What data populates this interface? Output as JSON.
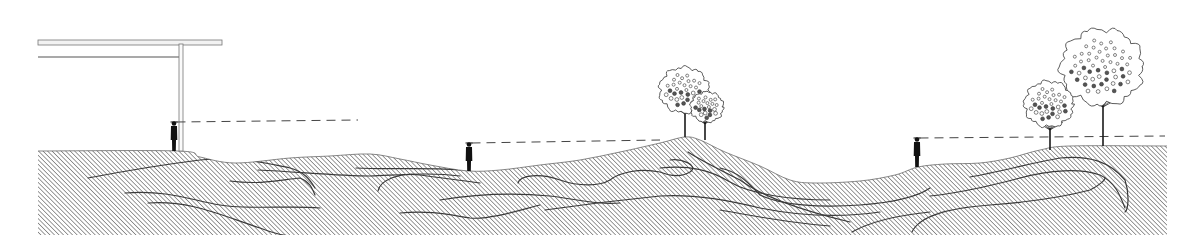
{
  "diagram": {
    "type": "landscape-section",
    "description": "Site section with hatched earth mounds, three observers with dashed sight lines, canopy structure and trees",
    "colors": {
      "background": "#ffffff",
      "ink": "#1a1a1a",
      "hatch": "#4a4a4a",
      "strata": "#3a3a3a",
      "figure": "#111111",
      "canopy_fill": "#f2f2f2"
    },
    "ground": {
      "bottom_y": 235,
      "left_x": 38,
      "right_x": 1167,
      "profile": [
        [
          38,
          151
        ],
        [
          178,
          151
        ],
        [
          200,
          157
        ],
        [
          235,
          163
        ],
        [
          290,
          158
        ],
        [
          330,
          156
        ],
        [
          370,
          154
        ],
        [
          400,
          159
        ],
        [
          430,
          165
        ],
        [
          468,
          171
        ],
        [
          500,
          170
        ],
        [
          540,
          165
        ],
        [
          580,
          160
        ],
        [
          620,
          152
        ],
        [
          660,
          143
        ],
        [
          685,
          137
        ],
        [
          700,
          140
        ],
        [
          725,
          152
        ],
        [
          760,
          166
        ],
        [
          790,
          180
        ],
        [
          815,
          183
        ],
        [
          860,
          181
        ],
        [
          895,
          175
        ],
        [
          918,
          167
        ],
        [
          945,
          164
        ],
        [
          980,
          163
        ],
        [
          1010,
          158
        ],
        [
          1040,
          150
        ],
        [
          1070,
          146
        ],
        [
          1167,
          146
        ]
      ]
    },
    "strata_lines": [
      "M88,178 C130,170 160,165 200,160 C240,156 260,162 290,168 C305,172 310,180 315,188",
      "M125,193 C170,190 190,200 220,205 C250,210 290,205 320,208",
      "M148,203 C190,200 220,215 260,228 C270,232 280,235 290,236",
      "M230,181 C260,185 280,180 300,178 C310,182 312,188 315,195",
      "M258,170 C300,172 340,176 370,176 C400,175 430,172 460,176",
      "M356,168 C390,170 420,167 460,170",
      "M378,191 C380,180 400,172 420,175 C440,178 460,180 480,183",
      "M400,213 C430,210 450,215 470,218 C490,220 520,210 540,205",
      "M440,200 C470,195 510,192 550,196 C580,200 600,205 620,203",
      "M518,183 C520,175 540,173 560,180 C580,187 600,186 610,180 C620,172 640,168 660,172 C670,176 680,178 690,172 C700,165 680,158 670,160",
      "M545,210 C580,205 620,200 660,196 C690,194 720,198 760,208 C800,216 840,218 880,212",
      "M660,168 C690,165 710,170 730,182 C750,194 790,200 830,200",
      "M688,152 C700,160 720,170 740,180 C760,195 800,210 850,222",
      "M720,168 C740,172 750,185 760,195 C780,205 820,208 860,205 C900,202 920,195 930,188",
      "M720,210 C750,215 780,222 830,226",
      "M930,196 C960,193 990,186 1020,178 C1050,170 1080,168 1100,175 C1115,182 1120,195 1125,208",
      "M970,177 C1000,172 1030,163 1060,158 C1090,155 1110,162 1125,180 C1130,195 1128,210 1125,212",
      "M912,232 C920,215 950,208 990,205 C1030,202 1060,198 1090,190 C1100,185 1105,180 1105,178",
      "M852,232 C870,222 900,215 930,212",
      "M38,237 C50,236 60,236 70,236"
    ],
    "canopy_structure": {
      "roof_top": {
        "x1": 38,
        "y1": 42,
        "x2": 222,
        "y2": 42,
        "thickness": 5
      },
      "beam": {
        "x1": 38,
        "y1": 57,
        "x2": 183,
        "y2": 57
      },
      "column": {
        "x": 181,
        "y_top": 44,
        "y_bottom": 151,
        "width": 4
      }
    },
    "observers": [
      {
        "id": "observer-1",
        "x": 174,
        "foot_y": 151,
        "height": 30,
        "eye_y": 122,
        "sightline_end_x": 358,
        "sightline_y": 120
      },
      {
        "id": "observer-2",
        "x": 469,
        "foot_y": 171,
        "height": 29,
        "eye_y": 143,
        "sightline_end_x": 660,
        "sightline_y": 140
      },
      {
        "id": "observer-3",
        "x": 917,
        "foot_y": 167,
        "height": 30,
        "eye_y": 138,
        "sightline_end_x": 1165,
        "sightline_y": 136
      }
    ],
    "trees": [
      {
        "id": "tree-1",
        "trunk_x": 685,
        "base_y": 137,
        "trunk_top_y": 112,
        "crown_cx": 684,
        "crown_cy": 90,
        "crown_r": 24
      },
      {
        "id": "tree-2",
        "trunk_x": 705,
        "base_y": 140,
        "trunk_top_y": 122,
        "crown_cx": 707,
        "crown_cy": 107,
        "crown_r": 16
      },
      {
        "id": "tree-3",
        "trunk_x": 1050,
        "base_y": 150,
        "trunk_top_y": 128,
        "crown_cx": 1049,
        "crown_cy": 104,
        "crown_r": 24
      },
      {
        "id": "tree-4",
        "trunk_x": 1103,
        "base_y": 146,
        "trunk_top_y": 105,
        "crown_cx": 1102,
        "crown_cy": 67,
        "crown_r": 40
      }
    ]
  }
}
